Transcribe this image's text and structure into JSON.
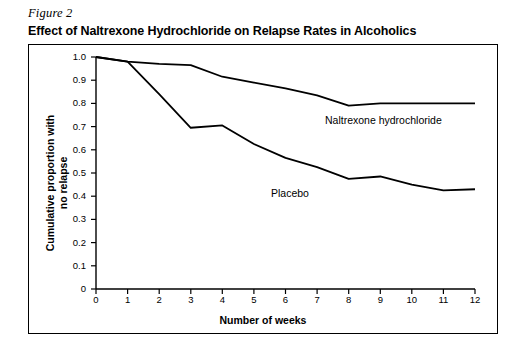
{
  "figure": {
    "label": "Figure 2",
    "title": "Effect of Naltrexone Hydrochloride on Relapse Rates in Alcoholics"
  },
  "chart_data": {
    "type": "line",
    "title": "Effect of Naltrexone Hydrochloride on Relapse Rates in Alcoholics",
    "xlabel": "Number of weeks",
    "ylabel": "Cumulative proportion with no relapse",
    "ylabel_line1": "Cumulative proportion with",
    "ylabel_line2": "no relapse",
    "x": [
      0,
      1,
      2,
      3,
      4,
      5,
      6,
      7,
      8,
      9,
      10,
      11,
      12
    ],
    "xlim": [
      0,
      12
    ],
    "ylim": [
      0,
      1.0
    ],
    "xticks": [
      "0",
      "1",
      "2",
      "3",
      "4",
      "5",
      "6",
      "7",
      "8",
      "9",
      "10",
      "11",
      "12"
    ],
    "yticks": [
      "0",
      "0.1",
      "0.2",
      "0.3",
      "0.4",
      "0.5",
      "0.6",
      "0.7",
      "0.8",
      "0.9",
      "1.0"
    ],
    "grid": false,
    "legend_position": "inline-annotation",
    "series": [
      {
        "name": "Naltrexone hydrochloride",
        "values": [
          1.0,
          0.98,
          0.97,
          0.965,
          0.915,
          0.89,
          0.865,
          0.835,
          0.79,
          0.8,
          0.8,
          0.8,
          0.8
        ]
      },
      {
        "name": "Placebo",
        "values": [
          1.0,
          0.98,
          0.84,
          0.695,
          0.705,
          0.625,
          0.565,
          0.525,
          0.475,
          0.485,
          0.45,
          0.425,
          0.43
        ]
      }
    ],
    "annotations": [
      {
        "text": "Naltrexone hydrochloride",
        "x": 7.4,
        "y": 0.855
      },
      {
        "text": "Placebo",
        "x": 5.9,
        "y": 0.6
      }
    ]
  }
}
